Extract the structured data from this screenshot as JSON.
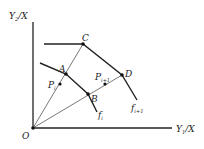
{
  "diagram": {
    "axes": {
      "y_label": "Y",
      "y_label_sub": "2",
      "y_label_tail": "/X",
      "x_label": "Y",
      "x_label_sub": "1",
      "x_label_tail": "/X",
      "origin_label": "O"
    },
    "points": {
      "A": "A",
      "B": "B",
      "C": "C",
      "D": "D",
      "Pi": "P",
      "Pi_sub": "i",
      "Pi1": "P",
      "Pi1_sub": "i+1"
    },
    "curves": {
      "fi": "f",
      "fi_sub": "i",
      "fi1": "f",
      "fi1_sub": "i+1"
    },
    "colors": {
      "line": "#222222",
      "thin_line": "#555555"
    }
  }
}
